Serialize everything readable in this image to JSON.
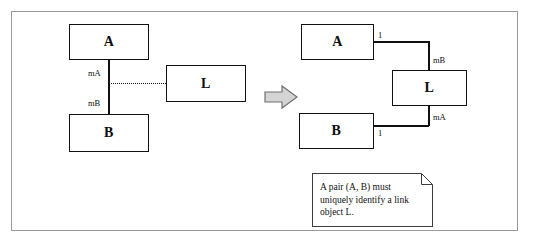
{
  "figure": {
    "left_diagram": {
      "boxes": [
        {
          "id": "left-a",
          "name": "A"
        },
        {
          "id": "left-b",
          "name": "B"
        },
        {
          "id": "left-l",
          "name": "L"
        }
      ],
      "labels": [
        {
          "id": "left-role-ma",
          "text": "mA"
        },
        {
          "id": "left-role-mb",
          "text": "mB"
        }
      ]
    },
    "transition": {
      "icon": "right-arrow-icon"
    },
    "right_diagram": {
      "boxes": [
        {
          "id": "right-a",
          "name": "A"
        },
        {
          "id": "right-b",
          "name": "B"
        },
        {
          "id": "right-l",
          "name": "L"
        }
      ],
      "labels": [
        {
          "id": "right-mult-a",
          "text": "1"
        },
        {
          "id": "right-role-mb",
          "text": "mB"
        },
        {
          "id": "right-role-ma",
          "text": "mA"
        },
        {
          "id": "right-mult-b",
          "text": "1"
        }
      ]
    },
    "note": {
      "text": "A pair (A, B) must uniquely identify a link object L."
    }
  },
  "colors": {
    "frame": "#9a9a9a",
    "stroke": "#111111",
    "arrow_fill": "#d4d4d4",
    "arrow_stroke": "#707070",
    "note_border": "#3c3c3c",
    "background": "#ffffff"
  }
}
